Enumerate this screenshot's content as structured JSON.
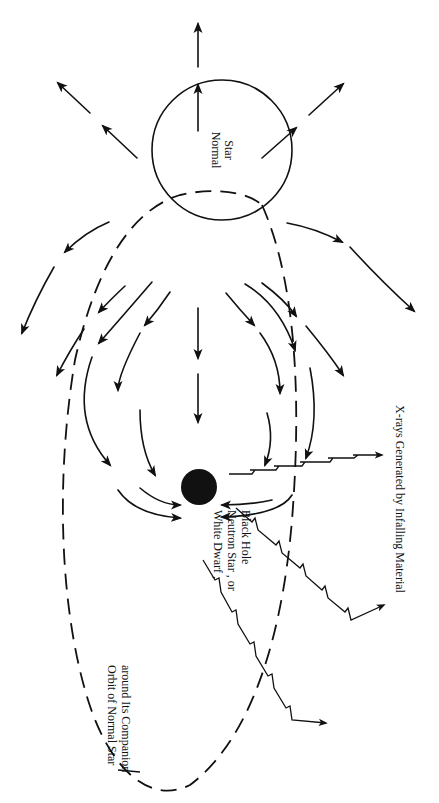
{
  "diagram": {
    "type": "x-ray binary schematic",
    "orientation": "rotated 90 degrees clockwise",
    "colors": {
      "ink": "#111111",
      "background": "#ffffff"
    },
    "labels": {
      "normal_star_line1": "Normal",
      "normal_star_line2": "Star",
      "compact_line1": "White Dwarf ,",
      "compact_line2": "Neutron Star , or",
      "compact_line3": "Black Hole",
      "xrays": "X-rays Generated by Infalling Material",
      "orbit_line1": "Orbit of Normal Star",
      "orbit_line2": "around Its Companion"
    },
    "elements": [
      {
        "name": "normal-star",
        "shape": "circle",
        "fill": "none"
      },
      {
        "name": "compact-object",
        "shape": "filled-circle",
        "fill": "#111111"
      },
      {
        "name": "orbit",
        "shape": "dashed-ellipse"
      },
      {
        "name": "stellar-wind-arrows",
        "shape": "dashed-arrows",
        "direction": "outward and toward companion"
      },
      {
        "name": "x-ray-bolts",
        "shape": "zigzag-arrows",
        "count": 3
      }
    ]
  }
}
